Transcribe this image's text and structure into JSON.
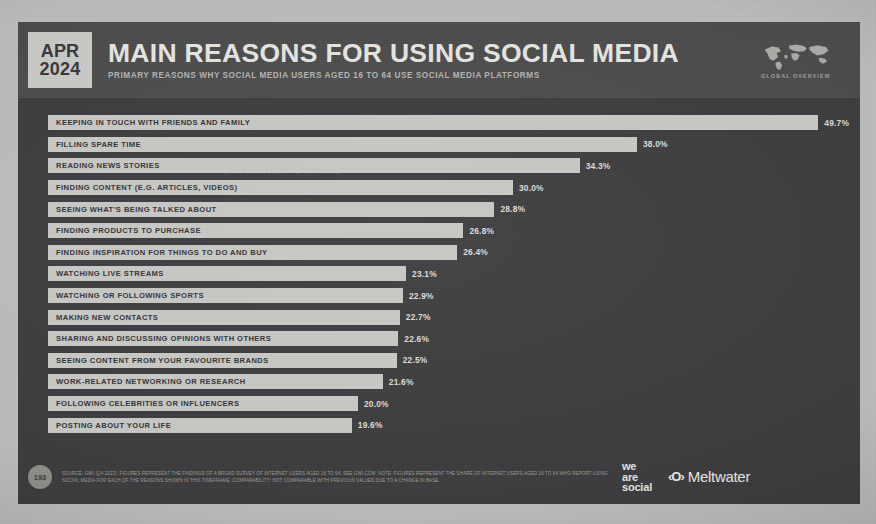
{
  "header": {
    "date_month": "APR",
    "date_year": "2024",
    "title": "MAIN REASONS FOR USING SOCIAL MEDIA",
    "subtitle": "PRIMARY REASONS WHY SOCIAL MEDIA USERS AGED 16 TO 64 USE SOCIAL MEDIA PLATFORMS",
    "global_overview_label": "GLOBAL OVERVIEW"
  },
  "watermark": "DATAREPORTAL",
  "footer": {
    "page_number": "193",
    "source_text": "SOURCE: GWI (Q4 2023). FIGURES REPRESENT THE FINDINGS OF A BROAD SURVEY OF INTERNET USERS AGED 16 TO 64. SEE GWI.COM. NOTE: FIGURES REPRESENT THE SHARE OF INTERNET USERS AGED 16 TO 64 WHO REPORT USING SOCIAL MEDIA FOR EACH OF THE REASONS SHOWN IN THIS TIMEFRAME. COMPARABILITY: NOT COMPARABLE WITH PREVIOUS VALUES DUE TO A CHANGE IN BASE.",
    "logo_we_are_social_line1": "we",
    "logo_we_are_social_line2": "are",
    "logo_we_are_social_line3": "social",
    "logo_meltwater_mark": "‹O›",
    "logo_meltwater_name": "Meltwater"
  },
  "colors": {
    "slide_background": "#3b3b3d",
    "header_background": "#4a4a4c",
    "bar_fill": "#c8c8c4",
    "bar_label_text": "#313135",
    "value_text": "#dededa",
    "date_badge_background": "#c9c9c5"
  },
  "chart_data": {
    "type": "bar",
    "orientation": "horizontal",
    "title": "MAIN REASONS FOR USING SOCIAL MEDIA",
    "subtitle": "PRIMARY REASONS WHY SOCIAL MEDIA USERS AGED 16 TO 64 USE SOCIAL MEDIA PLATFORMS",
    "xlabel": "",
    "ylabel": "",
    "xlim": [
      0,
      52
    ],
    "grid": false,
    "legend": false,
    "value_suffix": "%",
    "categories": [
      "KEEPING IN TOUCH WITH FRIENDS AND FAMILY",
      "FILLING SPARE TIME",
      "READING NEWS STORIES",
      "FINDING CONTENT (E.G. ARTICLES, VIDEOS)",
      "SEEING WHAT'S BEING TALKED ABOUT",
      "FINDING PRODUCTS TO PURCHASE",
      "FINDING INSPIRATION FOR THINGS TO DO AND BUY",
      "WATCHING LIVE STREAMS",
      "WATCHING OR FOLLOWING SPORTS",
      "MAKING NEW CONTACTS",
      "SHARING AND DISCUSSING OPINIONS WITH OTHERS",
      "SEEING CONTENT FROM YOUR FAVOURITE BRANDS",
      "WORK-RELATED NETWORKING OR RESEARCH",
      "FOLLOWING CELEBRITIES OR INFLUENCERS",
      "POSTING ABOUT YOUR LIFE"
    ],
    "values": [
      49.7,
      38.0,
      34.3,
      30.0,
      28.8,
      26.8,
      26.4,
      23.1,
      22.9,
      22.7,
      22.6,
      22.5,
      21.6,
      20.0,
      19.6
    ],
    "value_labels": [
      "49.7%",
      "38.0%",
      "34.3%",
      "30.0%",
      "28.8%",
      "26.8%",
      "26.4%",
      "23.1%",
      "22.9%",
      "22.7%",
      "22.6%",
      "22.5%",
      "21.6%",
      "20.0%",
      "19.6%"
    ]
  }
}
